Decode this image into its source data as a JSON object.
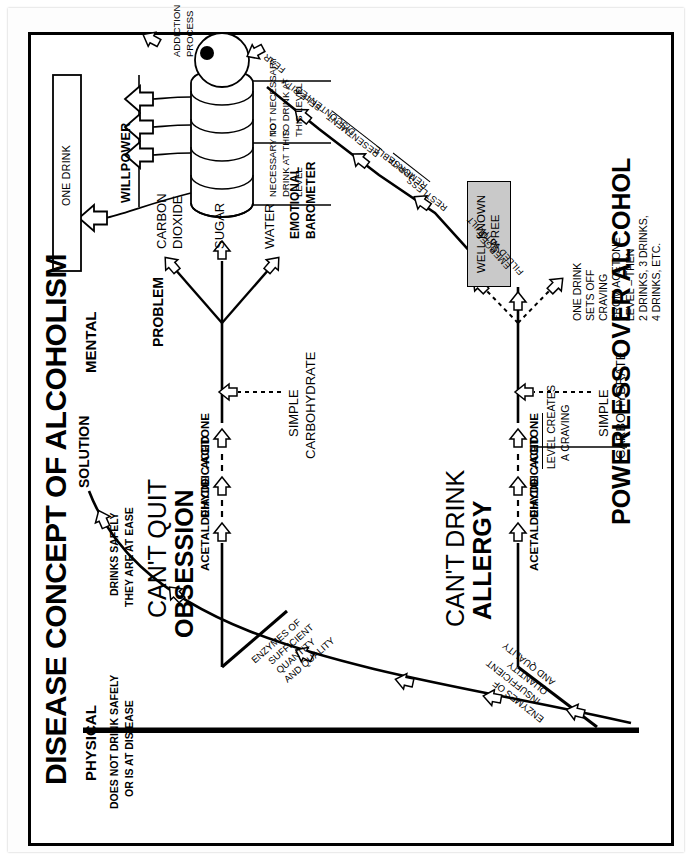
{
  "document": {
    "title": "DISEASE CONCEPT OF ALCOHOLISM"
  },
  "columns": {
    "physical": {
      "heading": "PHYSICAL",
      "caption_line1": "DOES NOT DRINK SAFELY",
      "caption_line2": "OR IS AT DIS-EASE"
    },
    "mental": {
      "heading": "MENTAL",
      "caption_line1": "DRINKS SAFELY",
      "caption_line2": "THEY ARE AT EASE"
    }
  },
  "stages": {
    "lower": {
      "line1": "CAN'T DRINK",
      "line2": "ALLERGY"
    },
    "upper": {
      "line1": "CAN'T QUIT",
      "line2": "OBSESSION"
    }
  },
  "enzymes": {
    "lower": [
      "ENZYMES OF",
      "INSUFFICIENT",
      "QUANTITY",
      "AND QUALITY"
    ],
    "upper": [
      "ENZYMES OF",
      "SUFFICIENT",
      "QUANTITY",
      "AND QUALITY"
    ]
  },
  "metabolism": {
    "chain": [
      "ACETALDEHYDE",
      "DIACIDIC ACID",
      "ACETONE"
    ],
    "acetone_note_line1": "LEVEL CREATES",
    "acetone_note_line2": "A CRAVING",
    "input_line1": "SIMPLE",
    "input_line2": "CARBOHYDRATE",
    "products": [
      "WATER",
      "SUGAR",
      "CARBON",
      "DIOXIDE"
    ],
    "products_labels": [
      "WATER",
      "SUGAR",
      "CARBON DIOXIDE"
    ]
  },
  "craving_note": [
    "ONE DRINK",
    "SETS OFF",
    "CRAVING",
    "FROM ACETONE",
    "LEVEL – THEN",
    "2 DRINKS, 3 DRINKS,",
    "4 DRINKS, ETC."
  ],
  "spree": {
    "line1": "WELL KNOWN",
    "line2": "SPREE"
  },
  "emotional_chain": [
    "EMERGES",
    "FILLED WITH",
    "GUILT",
    "RESTLESS",
    "IRRITABLE",
    "REMORSE",
    "RESENTMENT",
    "DISCONTENTED",
    "SELF-PITY",
    "FEAR"
  ],
  "barometer": {
    "label_line1": "EMOTIONAL",
    "label_line2": "BAROMETER",
    "bulb_marker": "100%",
    "scale_high_line1": "NECESSARY TO",
    "scale_high_line2": "DRINK AT THIS",
    "scale_high_line3": "LEVEL",
    "scale_low_line1": "NOT NECESSARY",
    "scale_low_line2": "TO DRINK AT",
    "scale_low_line3": "THIS LEVEL",
    "addiction_line1": "ADDICTION",
    "addiction_line2": "PROCESS"
  },
  "problem_label": "PROBLEM",
  "solution_label": "SOLUTION",
  "willpower_label": "WILLPOWER",
  "one_drink_label": "ONE DRINK",
  "footer_banner": "POWERLESS OVER ALCOHOL",
  "colors": {
    "ink": "#000000",
    "paper": "#ffffff",
    "spree_fill": "#c9c9c9",
    "frame": "#000000"
  }
}
